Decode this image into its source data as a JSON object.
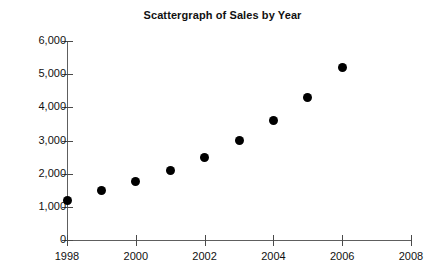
{
  "chart_data": {
    "type": "scatter",
    "title": "Scattergraph of Sales by Year",
    "xlabel": "",
    "ylabel": "",
    "x": [
      1998,
      1999,
      2000,
      2001,
      2002,
      2003,
      2004,
      2005,
      2006
    ],
    "values": [
      1200,
      1500,
      1750,
      2100,
      2500,
      3000,
      3600,
      4300,
      5200
    ],
    "series": [
      {
        "name": "Sales",
        "points": [
          {
            "x": 1998,
            "y": 1200
          },
          {
            "x": 1999,
            "y": 1500
          },
          {
            "x": 2000,
            "y": 1750
          },
          {
            "x": 2001,
            "y": 2100
          },
          {
            "x": 2002,
            "y": 2500
          },
          {
            "x": 2003,
            "y": 3000
          },
          {
            "x": 2004,
            "y": 3600
          },
          {
            "x": 2005,
            "y": 4300
          },
          {
            "x": 2006,
            "y": 5200
          }
        ]
      }
    ],
    "xlim": [
      1998,
      2008
    ],
    "ylim": [
      0,
      6000
    ],
    "xticks": [
      1998,
      2000,
      2002,
      2004,
      2006,
      2008
    ],
    "xtick_labels": [
      "1998",
      "2000",
      "2002",
      "2004",
      "2006",
      "2008"
    ],
    "yticks": [
      0,
      1000,
      2000,
      3000,
      4000,
      5000,
      6000
    ],
    "ytick_labels": [
      "0",
      "1,000",
      "2,000",
      "3,000",
      "4,000",
      "5,000",
      "6,000"
    ],
    "grid": false,
    "legend": null,
    "marker_color": "#000000",
    "axis_color": "#5e5e5e",
    "background_color": "#ffffff"
  }
}
